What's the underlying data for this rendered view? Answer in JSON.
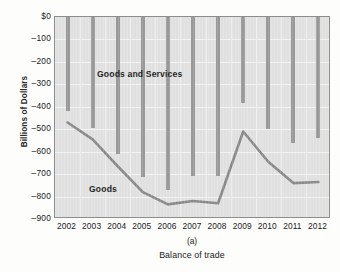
{
  "chart_data": {
    "type": "bar",
    "title": "",
    "subtitle": "",
    "panel_letter": "(a)",
    "caption": "Balance of trade",
    "xlabel": "",
    "ylabel": "Billions of Dollars",
    "categories": [
      "2002",
      "2003",
      "2004",
      "2005",
      "2006",
      "2007",
      "2008",
      "2009",
      "2010",
      "2011",
      "2012"
    ],
    "ylim": [
      -900,
      0
    ],
    "yticks": [
      0,
      -100,
      -200,
      -300,
      -400,
      -500,
      -600,
      -700,
      -800,
      -900
    ],
    "ytick_labels": [
      "$0",
      "–100",
      "–200",
      "–300",
      "–400",
      "–500",
      "–600",
      "–700",
      "–800",
      "–900"
    ],
    "grid": true,
    "legend_position": "in-plot-annotation",
    "series": [
      {
        "name": "Goods and Services",
        "type": "bar",
        "color": "#9a9a9a",
        "values": [
          -420,
          -495,
          -610,
          -715,
          -770,
          -710,
          -710,
          -385,
          -500,
          -560,
          -540
        ]
      },
      {
        "name": "Goods",
        "type": "line",
        "color": "#8a8a8a",
        "values": [
          -470,
          -545,
          -665,
          -780,
          -835,
          -820,
          -830,
          -510,
          -645,
          -740,
          -735
        ]
      }
    ],
    "annotations": [
      {
        "text": "Goods and Services",
        "series": "Goods and Services"
      },
      {
        "text": "Goods",
        "series": "Goods"
      }
    ]
  }
}
